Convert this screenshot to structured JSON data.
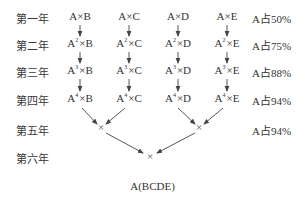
{
  "years": [
    "第一年",
    "第二年",
    "第三年",
    "第四年",
    "第五年",
    "第六年"
  ],
  "grid": [
    [
      {
        "base": "A",
        "sup": "",
        "partner": "B"
      },
      {
        "base": "A",
        "sup": "",
        "partner": "C"
      },
      {
        "base": "A",
        "sup": "",
        "partner": "D"
      },
      {
        "base": "A",
        "sup": "",
        "partner": "E"
      }
    ],
    [
      {
        "base": "A",
        "sup": "2",
        "partner": "B"
      },
      {
        "base": "A",
        "sup": "2",
        "partner": "C"
      },
      {
        "base": "A",
        "sup": "2",
        "partner": "D"
      },
      {
        "base": "A",
        "sup": "2",
        "partner": "E"
      }
    ],
    [
      {
        "base": "A",
        "sup": "3",
        "partner": "B"
      },
      {
        "base": "A",
        "sup": "3",
        "partner": "C"
      },
      {
        "base": "A",
        "sup": "3",
        "partner": "D"
      },
      {
        "base": "A",
        "sup": "3",
        "partner": "E"
      }
    ],
    [
      {
        "base": "A",
        "sup": "4",
        "partner": "B"
      },
      {
        "base": "A",
        "sup": "4",
        "partner": "C"
      },
      {
        "base": "A",
        "sup": "4",
        "partner": "D"
      },
      {
        "base": "A",
        "sup": "4",
        "partner": "E"
      }
    ]
  ],
  "cross_symbol": "×",
  "percentages": [
    "A占50%",
    "A占75%",
    "A占88%",
    "A占94%",
    "A占94%"
  ],
  "cross_points": {
    "year5_left": "×",
    "year5_right": "×",
    "year6_center": "×"
  },
  "result": "A(BCDE)",
  "colors": {
    "text": "#333333",
    "lines": "#444444"
  }
}
